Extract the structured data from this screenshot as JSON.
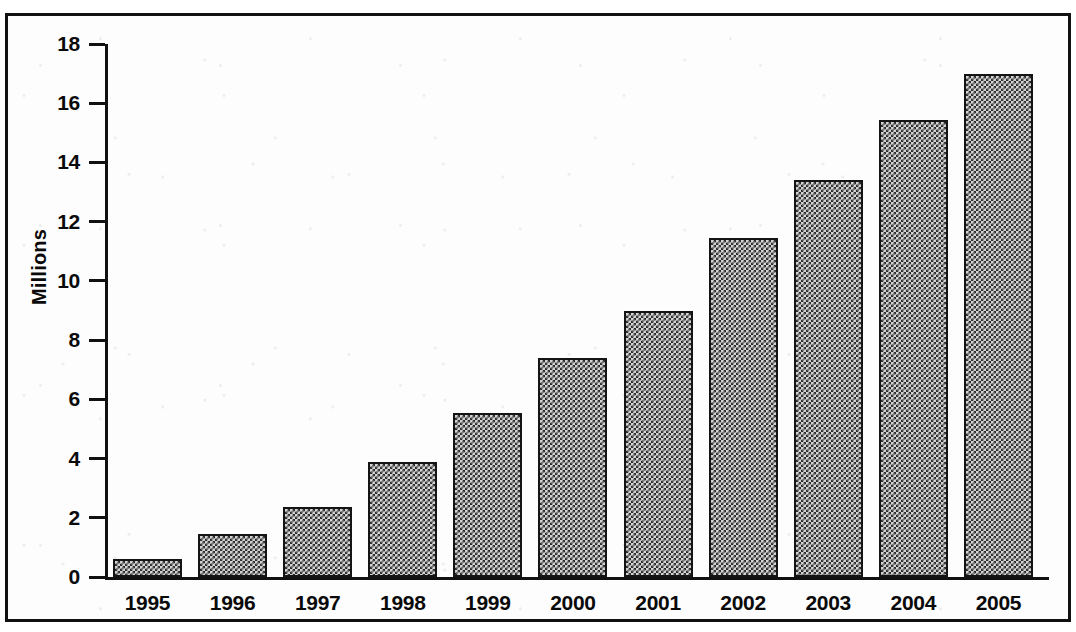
{
  "chart_data": {
    "type": "bar",
    "title": "",
    "subtitle": "",
    "xlabel": "",
    "ylabel": "Millions",
    "categories": [
      "1995",
      "1996",
      "1997",
      "1998",
      "1999",
      "2000",
      "2001",
      "2002",
      "2003",
      "2004",
      "2005"
    ],
    "values": [
      0.6,
      1.45,
      2.35,
      3.9,
      5.55,
      7.4,
      9.0,
      11.45,
      13.4,
      15.45,
      17.0
    ],
    "ylim": [
      0,
      18
    ],
    "yticks": [
      0,
      2,
      4,
      6,
      8,
      10,
      12,
      14,
      16,
      18
    ],
    "ytick_labels": [
      "0",
      "2",
      "4",
      "6",
      "8",
      "10",
      "12",
      "14",
      "16",
      "18"
    ],
    "xtick_labels": [
      "1995",
      "1996",
      "1997",
      "1998",
      "1999",
      "2000",
      "2001",
      "2002",
      "2003",
      "2004",
      "2005"
    ],
    "grid": false,
    "legend": null,
    "legend_position": "none",
    "annotations": [],
    "bar_fill": "#d3d3d3",
    "bar_edge": "#141414",
    "background": "#ffffff",
    "frame_color": "#111111"
  },
  "axes": {
    "y_title": "Millions",
    "y_tick_labels": [
      "18",
      "16",
      "14",
      "12",
      "10",
      "8",
      "6",
      "4",
      "2",
      "0"
    ],
    "x_tick_labels": [
      "1995",
      "1996",
      "1997",
      "1998",
      "1999",
      "2000",
      "2001",
      "2002",
      "2003",
      "2004",
      "2005"
    ]
  }
}
